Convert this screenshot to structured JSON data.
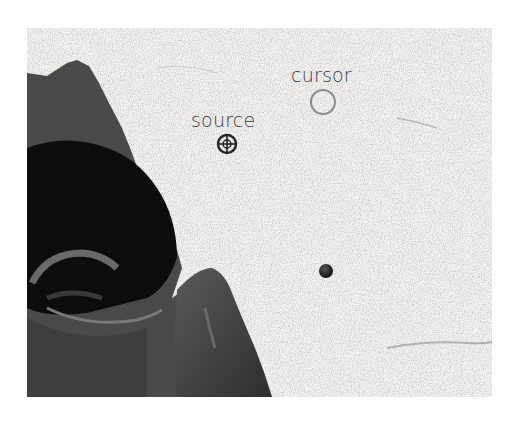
{
  "illustration": {
    "labels": {
      "source": "source",
      "cursor": "cursor"
    },
    "markers": {
      "source_icon": "crosshair-icon",
      "cursor_icon": "circle-brush-icon",
      "sample_dot": "dot"
    },
    "colors": {
      "background": "#ffffff",
      "stone_texture": "#f0efed",
      "statue_dark": "#1a1a1a",
      "statue_mid": "#4a4a4a",
      "cursor_ring": "#8a8a8a",
      "crosshair": "#222222"
    }
  }
}
